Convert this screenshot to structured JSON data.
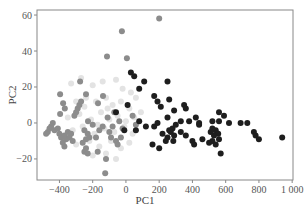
{
  "chart_data": {
    "type": "scatter",
    "title": "",
    "xlabel": "PC1",
    "ylabel": "PC2",
    "xlim": [
      -535,
      1005
    ],
    "ylim": [
      -31.7,
      62.8
    ],
    "xticks": [
      -400,
      -200,
      0,
      200,
      400,
      600,
      800,
      1000
    ],
    "xtick_labels": [
      "−400",
      "−200",
      "0",
      "200",
      "400",
      "600",
      "800",
      "1 000"
    ],
    "yticks": [
      -20,
      0,
      20,
      40,
      60
    ],
    "ytick_labels": [
      "−20",
      "0",
      "20",
      "40",
      "60"
    ],
    "grid": false,
    "legend": null,
    "series": [
      {
        "name": "group-light",
        "color": "#e3e3e3",
        "points": [
          [
            -330,
            22
          ],
          [
            -270,
            25
          ],
          [
            -200,
            21
          ],
          [
            -140,
            23
          ],
          [
            -60,
            24
          ],
          [
            -20,
            19
          ],
          [
            -300,
            12
          ],
          [
            -240,
            14
          ],
          [
            -180,
            12
          ],
          [
            -120,
            14
          ],
          [
            -80,
            10
          ],
          [
            -30,
            12
          ],
          [
            20,
            8
          ],
          [
            -350,
            3
          ],
          [
            -280,
            5
          ],
          [
            -210,
            2
          ],
          [
            -150,
            6
          ],
          [
            -100,
            2
          ],
          [
            -50,
            4
          ],
          [
            0,
            1
          ],
          [
            50,
            3
          ],
          [
            90,
            6
          ],
          [
            -320,
            -4
          ],
          [
            -260,
            -2
          ],
          [
            -190,
            -6
          ],
          [
            -130,
            -3
          ],
          [
            -70,
            -5
          ],
          [
            -10,
            -2
          ],
          [
            40,
            -6
          ],
          [
            -300,
            -12
          ],
          [
            -220,
            -10
          ],
          [
            -160,
            -13
          ],
          [
            -90,
            -10
          ],
          [
            -30,
            -14
          ],
          [
            20,
            -11
          ],
          [
            -200,
            -18
          ],
          [
            -120,
            -17
          ],
          [
            -60,
            -20
          ],
          [
            30,
            17
          ],
          [
            60,
            14
          ],
          [
            -250,
            9
          ],
          [
            -170,
            -1
          ],
          [
            -110,
            8
          ]
        ]
      },
      {
        "name": "group-mid",
        "color": "#8c8c8c",
        "points": [
          [
            200,
            58
          ],
          [
            -24,
            51
          ],
          [
            -114,
            37
          ],
          [
            6,
            36
          ],
          [
            -276,
            23
          ],
          [
            -240,
            16
          ],
          [
            -396,
            16
          ],
          [
            -378,
            11
          ],
          [
            -368,
            8
          ],
          [
            -396,
            5
          ],
          [
            -228,
            1
          ],
          [
            -168,
            11
          ],
          [
            -138,
            15
          ],
          [
            -300,
            6
          ],
          [
            -290,
            8
          ],
          [
            -280,
            10
          ],
          [
            -270,
            12
          ],
          [
            -310,
            4
          ],
          [
            -440,
            0
          ],
          [
            -450,
            -2
          ],
          [
            -430,
            -4
          ],
          [
            -410,
            -3
          ],
          [
            -470,
            -5
          ],
          [
            -480,
            -6
          ],
          [
            -460,
            -3
          ],
          [
            -400,
            -6
          ],
          [
            -390,
            -8
          ],
          [
            -370,
            -7
          ],
          [
            -360,
            -9
          ],
          [
            -350,
            -5
          ],
          [
            -340,
            -8
          ],
          [
            -330,
            -6
          ],
          [
            -380,
            -11
          ],
          [
            -370,
            -13
          ],
          [
            -320,
            -10
          ],
          [
            -250,
            -4
          ],
          [
            -230,
            -6
          ],
          [
            -240,
            -9
          ],
          [
            -220,
            -8
          ],
          [
            -260,
            -11
          ],
          [
            -240,
            -14
          ],
          [
            -250,
            -16
          ],
          [
            -230,
            -17
          ],
          [
            -170,
            -16
          ],
          [
            -120,
            -20
          ],
          [
            -125,
            -28
          ],
          [
            -100,
            -5
          ],
          [
            -90,
            -8
          ],
          [
            -60,
            -10
          ],
          [
            -50,
            -12
          ],
          [
            -80,
            -2
          ],
          [
            -40,
            1
          ],
          [
            -20,
            -3
          ],
          [
            -180,
            -8
          ],
          [
            -160,
            -4
          ],
          [
            -140,
            -2
          ],
          [
            -200,
            -1
          ],
          [
            -110,
            3
          ],
          [
            -70,
            6
          ],
          [
            -30,
            -8
          ],
          [
            40,
            4
          ],
          [
            60,
            -1
          ]
        ]
      },
      {
        "name": "group-dark",
        "color": "#1e1e1e",
        "points": [
          [
            30,
            28
          ],
          [
            50,
            26
          ],
          [
            110,
            23
          ],
          [
            80,
            19
          ],
          [
            250,
            23
          ],
          [
            170,
            15
          ],
          [
            190,
            12
          ],
          [
            10,
            10
          ],
          [
            260,
            13
          ],
          [
            210,
            9
          ],
          [
            350,
            10
          ],
          [
            360,
            8
          ],
          [
            290,
            7
          ],
          [
            560,
            6
          ],
          [
            590,
            4
          ],
          [
            420,
            3
          ],
          [
            120,
            -2
          ],
          [
            170,
            -2
          ],
          [
            190,
            0
          ],
          [
            250,
            3
          ],
          [
            380,
            1
          ],
          [
            440,
            -1
          ],
          [
            620,
            0
          ],
          [
            520,
            1
          ],
          [
            220,
            -6
          ],
          [
            260,
            -4
          ],
          [
            280,
            -3
          ],
          [
            300,
            -1
          ],
          [
            270,
            -5
          ],
          [
            290,
            -7
          ],
          [
            250,
            -8
          ],
          [
            240,
            -10
          ],
          [
            330,
            -5
          ],
          [
            360,
            -7
          ],
          [
            330,
            1
          ],
          [
            440,
            0
          ],
          [
            520,
            -3
          ],
          [
            540,
            -4
          ],
          [
            555,
            -6
          ],
          [
            530,
            -7
          ],
          [
            510,
            -5
          ],
          [
            560,
            1
          ],
          [
            460,
            -9
          ],
          [
            500,
            -11
          ],
          [
            520,
            -10
          ],
          [
            540,
            -12
          ],
          [
            560,
            -9
          ],
          [
            570,
            -17
          ],
          [
            690,
            0
          ],
          [
            730,
            0
          ],
          [
            770,
            -5
          ],
          [
            780,
            -7
          ],
          [
            800,
            -9
          ],
          [
            940,
            -8
          ],
          [
            400,
            -10
          ],
          [
            410,
            -12
          ],
          [
            285,
            -10
          ],
          [
            200,
            -14
          ],
          [
            160,
            -12
          ],
          [
            60,
            -4
          ],
          [
            80,
            1
          ],
          [
            -60,
            6
          ],
          [
            -10,
            -4
          ]
        ]
      }
    ]
  }
}
